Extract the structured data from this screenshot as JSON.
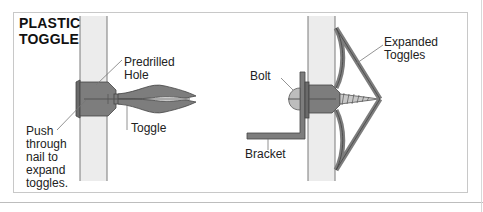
{
  "title": "PLASTIC\nTOGGLE",
  "left_figure": {
    "labels": {
      "predrilled_hole": "Predrilled\nHole",
      "toggle": "Toggle",
      "push_through": "Push\nthrough\nnail to\nexpand\ntoggles."
    }
  },
  "right_figure": {
    "labels": {
      "bolt": "Bolt",
      "expanded_toggles": "Expanded\nToggles",
      "bracket": "Bracket"
    }
  },
  "colors": {
    "wall_fill": "#ececec",
    "wall_edge": "#7a7a7a",
    "toggle_fill": "#7d7d7d",
    "toggle_dark": "#555555",
    "leader_line": "#777777",
    "frame_border": "#c8c8c8"
  }
}
